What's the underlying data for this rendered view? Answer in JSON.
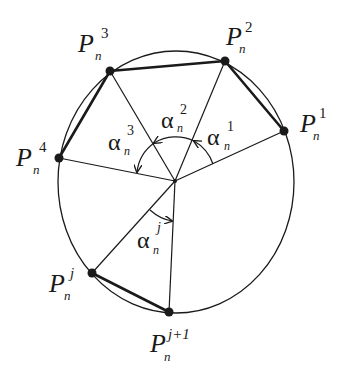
{
  "diagram": {
    "center": {
      "x": 175,
      "y": 181
    },
    "curve": {
      "cx": 176,
      "cy": 182,
      "rx": 118,
      "ry": 131
    },
    "colors": {
      "stroke": "#1a1a1a",
      "background": "#ffffff"
    },
    "points": [
      {
        "id": "P1",
        "base": "P",
        "sup": "1",
        "sub": "n",
        "x": 284,
        "y": 131
      },
      {
        "id": "P2",
        "base": "P",
        "sup": "2",
        "sub": "n",
        "x": 225,
        "y": 61
      },
      {
        "id": "P3",
        "base": "P",
        "sup": "3",
        "sub": "n",
        "x": 110,
        "y": 71
      },
      {
        "id": "P4",
        "base": "P",
        "sup": "4",
        "sub": "n",
        "x": 59,
        "y": 158
      },
      {
        "id": "Pj",
        "base": "P",
        "sup": "j",
        "sub": "n",
        "x": 92,
        "y": 273
      },
      {
        "id": "Pj1",
        "base": "P",
        "sup": "j+1",
        "sub": "n",
        "x": 169,
        "y": 312
      }
    ],
    "angles": [
      {
        "id": "alpha1",
        "base": "α",
        "sup": "1",
        "sub": "n"
      },
      {
        "id": "alpha2",
        "base": "α",
        "sup": "2",
        "sub": "n"
      },
      {
        "id": "alpha3",
        "base": "α",
        "sup": "3",
        "sub": "n"
      },
      {
        "id": "alphaj",
        "base": "α",
        "sup": "j",
        "sub": "n"
      }
    ]
  }
}
